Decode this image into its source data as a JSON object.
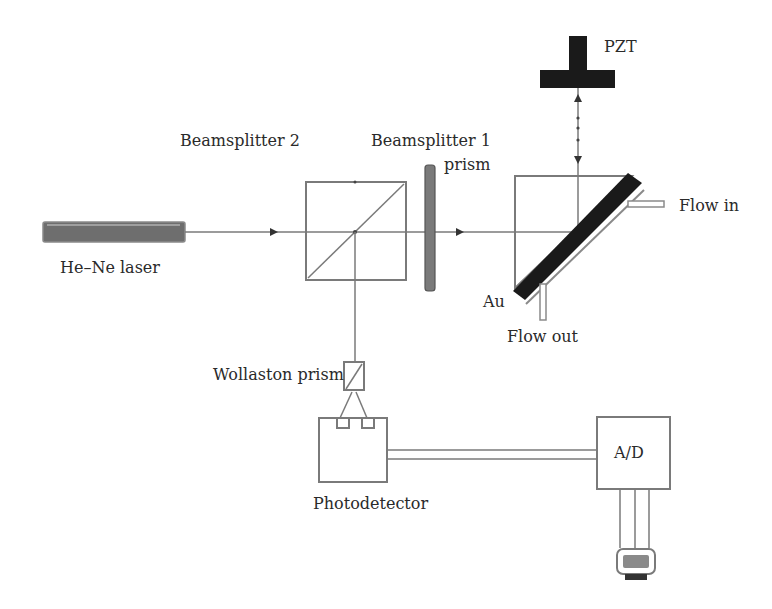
{
  "diagram": {
    "type": "optical-setup-schematic",
    "labels": {
      "laser": "He–Ne laser",
      "beamsplitter2": "Beamsplitter 2",
      "beamsplitter1_line1": "Beamsplitter 1",
      "beamsplitter1_line2": "prism",
      "pzt": "PZT",
      "flow_in": "Flow in",
      "flow_out": "Flow out",
      "au": "Au",
      "wollaston": "Wollaston prism",
      "photodetector": "Photodetector",
      "ad": "A/D"
    },
    "colors": {
      "line": "#7a7a7a",
      "dark_fill": "#1a1a1a",
      "laser_fill": "#6e6e6e",
      "text": "#2a2a2a",
      "background": "#ffffff"
    }
  }
}
